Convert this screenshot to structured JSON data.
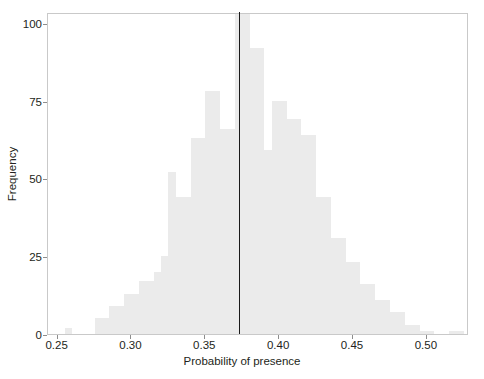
{
  "chart_data": {
    "type": "bar",
    "title": "",
    "subtitle": "",
    "xlabel": "Probability of presence",
    "ylabel": "Frequency",
    "xlim": [
      0.2435,
      0.5285
    ],
    "ylim": [
      0,
      103.5
    ],
    "xticks": [
      0.25,
      0.3,
      0.35,
      0.4,
      0.45,
      0.5
    ],
    "xticklabels": [
      "0.25",
      "0.30",
      "0.35",
      "0.40",
      "0.45",
      "0.50"
    ],
    "yticks": [
      0,
      25,
      50,
      75,
      100
    ],
    "yticklabels": [
      "0",
      "25",
      "50",
      "75",
      "100"
    ],
    "grid": false,
    "legend": null,
    "bar_color": "#ebebeb",
    "bin_width": 0.005,
    "bin_starts": [
      0.255,
      0.26,
      0.265,
      0.27,
      0.275,
      0.28,
      0.285,
      0.29,
      0.295,
      0.3,
      0.305,
      0.31,
      0.315,
      0.32,
      0.325,
      0.33,
      0.335,
      0.34,
      0.345,
      0.35,
      0.355,
      0.36,
      0.365,
      0.37,
      0.375,
      0.38,
      0.385,
      0.39,
      0.395,
      0.4,
      0.405,
      0.41,
      0.415,
      0.42,
      0.425,
      0.43,
      0.435,
      0.44,
      0.445,
      0.45,
      0.455,
      0.46,
      0.465,
      0.47,
      0.475,
      0.48,
      0.485,
      0.49,
      0.495,
      0.5,
      0.505,
      0.51,
      0.515,
      0.52
    ],
    "values": [
      2,
      0,
      0,
      0,
      5,
      5,
      9,
      9,
      13,
      13,
      17,
      17,
      20,
      25,
      52,
      44,
      44,
      63,
      63,
      78,
      78,
      66,
      66,
      103,
      103,
      92,
      92,
      59,
      75,
      75,
      69,
      69,
      64,
      64,
      44,
      44,
      31,
      31,
      23,
      23,
      16,
      16,
      11,
      11,
      7,
      7,
      3,
      3,
      1,
      1,
      0,
      0,
      1,
      1
    ],
    "annotations": [
      {
        "name": "vertical-reference-line",
        "type": "vline",
        "x": 0.3725,
        "color": "#1a1a1a"
      }
    ]
  }
}
